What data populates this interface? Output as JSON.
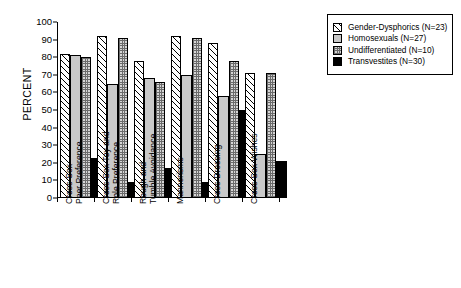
{
  "chart_data": {
    "type": "bar",
    "title": "",
    "xlabel": "",
    "ylabel": "PERCENT",
    "ylim": [
      0,
      100
    ],
    "yticks": [
      0,
      10,
      20,
      30,
      40,
      50,
      60,
      70,
      80,
      90,
      100
    ],
    "grid": false,
    "legend_position": "right",
    "categories": [
      "Cross-Sex\nPeer Preference",
      "Cross-Sex Toy and\nRole Preference",
      "Rough and\nTumble Avoidance",
      "Mannerisms",
      "Cross-Dressing",
      "Cross-Sex Wishes"
    ],
    "series": [
      {
        "name": "Gender-Dysphorics (N=23)",
        "pattern": "diagonal-hatch",
        "values": [
          82,
          92,
          78,
          92,
          88,
          71
        ]
      },
      {
        "name": "Homosexuals (N=27)",
        "pattern": "solid-grey",
        "values": [
          81,
          65,
          68,
          70,
          58,
          25
        ]
      },
      {
        "name": "Undifferentiated (N=10)",
        "pattern": "checkered",
        "values": [
          80,
          91,
          66,
          91,
          78,
          71
        ]
      },
      {
        "name": "Transvestites (N=30)",
        "pattern": "solid-black",
        "values": [
          23,
          9,
          17,
          9,
          50,
          21
        ]
      }
    ]
  },
  "legend": {
    "items": [
      {
        "label": "Gender-Dysphorics (N=23)"
      },
      {
        "label": "Homosexuals (N=27)"
      },
      {
        "label": "Undifferentiated (N=10)"
      },
      {
        "label": "Transvestites (N=30)"
      }
    ]
  },
  "axes": {
    "y_title": "PERCENT"
  }
}
